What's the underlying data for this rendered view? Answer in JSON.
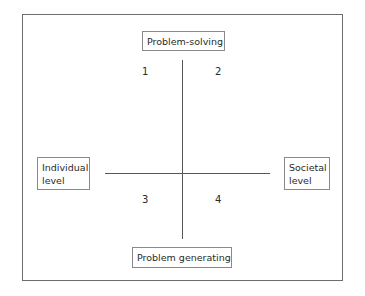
{
  "diagram": {
    "axes": {
      "top": "Problem-solving",
      "bottom": "Problem generating",
      "left_line1": "Individual",
      "left_line2": "level",
      "right_line1": "Societal",
      "right_line2": "level"
    },
    "quadrants": [
      "1",
      "2",
      "3",
      "4"
    ]
  }
}
